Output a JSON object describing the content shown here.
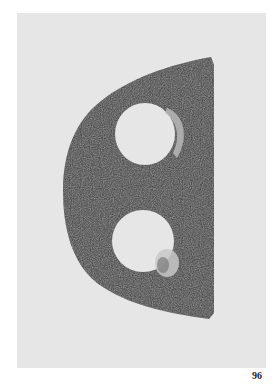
{
  "page": {
    "background": "#ffffff",
    "page_number": "96"
  },
  "plate": {
    "background": "#e6e6e6",
    "subject": "D-shaped corroded iron artifact with two openings",
    "object_color": "#3a3a3a"
  }
}
